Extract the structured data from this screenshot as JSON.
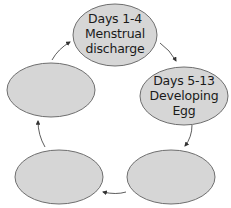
{
  "diagram": {
    "type": "cycle",
    "colors": {
      "node_fill": "#d6d6d6",
      "node_stroke": "#6e6e6e",
      "arrow": "#333333",
      "text": "#1a1a1a"
    },
    "nodes": [
      {
        "id": "top",
        "lines": [
          "Days 1-4",
          "Menstrual",
          "discharge"
        ]
      },
      {
        "id": "right",
        "lines": [
          "Days 5-13",
          "Developing",
          "Egg"
        ]
      },
      {
        "id": "bottom-right",
        "lines": []
      },
      {
        "id": "bottom-left",
        "lines": []
      },
      {
        "id": "left",
        "lines": []
      }
    ],
    "edges": [
      {
        "from": "top",
        "to": "right"
      },
      {
        "from": "right",
        "to": "bottom-right"
      },
      {
        "from": "bottom-right",
        "to": "bottom-left"
      },
      {
        "from": "bottom-left",
        "to": "left"
      },
      {
        "from": "left",
        "to": "top"
      }
    ]
  }
}
